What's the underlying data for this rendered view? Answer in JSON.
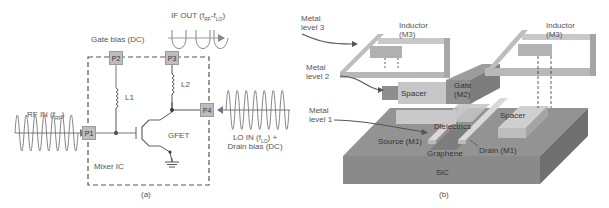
{
  "panel_a": {
    "caption": "(a)",
    "labels": {
      "gate_bias": "Gate bias (DC)",
      "if_out": "IF OUT (f",
      "if_out_sub1": "RF",
      "if_out_mid": "-f",
      "if_out_sub2": "LO",
      "if_out_end": ")",
      "rf_in": "RF IN (f",
      "rf_in_sub": "RF",
      "rf_in_end": ")",
      "lo_in": "LO IN (f",
      "lo_in_sub": "LO",
      "lo_in_end": ") +",
      "drain_bias": "Drain bias (DC)",
      "mixer_ic": "Mixer IC",
      "gfet": "GFET",
      "l1": "L1",
      "l2": "L2"
    },
    "ports": [
      "P1",
      "P2",
      "P3",
      "P4"
    ]
  },
  "panel_b": {
    "caption": "(b)",
    "labels": {
      "metal_level_3": "Metal level 3",
      "metal_level_3_l1": "Metal",
      "metal_level_3_l2": "level 3",
      "metal_level_2_l1": "Metal",
      "metal_level_2_l2": "level 2",
      "metal_level_1_l1": "Metal",
      "metal_level_1_l2": "level 1",
      "inductor_left_l1": "Inductor",
      "inductor_left_l2": "(M3)",
      "inductor_right_l1": "Inductor",
      "inductor_right_l2": "(M3)",
      "gate_l1": "Gate",
      "gate_l2": "(M2)",
      "spacer_left": "Spacer",
      "spacer_right": "Spacer",
      "dielectrics": "Dielectrics",
      "source": "Source (M1)",
      "drain": "Drain (M1)",
      "graphene": "Graphene",
      "sic": "SiC"
    }
  },
  "colors": {
    "port_fill": "#bdbdbd",
    "line": "#555555",
    "substrate_top": "#8f8f8f",
    "substrate_front": "#8a8a8a",
    "substrate_side": "#6e6e6e",
    "metal_light": "#c8c8c8",
    "metal_mid": "#a9a9a9",
    "metal_dark": "#8c8c8c"
  }
}
